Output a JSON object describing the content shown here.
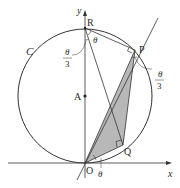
{
  "figure": {
    "type": "geometry-diagram",
    "axes": {
      "x_label": "x",
      "y_label": "y"
    },
    "circle": {
      "label": "C",
      "center_label": "A"
    },
    "points": {
      "origin": "O",
      "center": "A",
      "top": "R",
      "p": "P",
      "q": "Q"
    },
    "angles": {
      "at_R": "θ",
      "at_R_left": {
        "num": "θ",
        "den": "3"
      },
      "at_P_right": {
        "num": "θ",
        "den": "3"
      },
      "at_O": "θ"
    },
    "colors": {
      "line": "#333333",
      "fill": "#b5b5b5",
      "background": "#ffffff"
    }
  }
}
